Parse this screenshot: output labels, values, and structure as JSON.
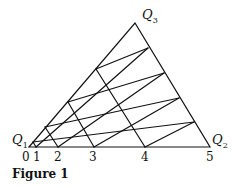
{
  "vertices": {
    "q1": {
      "label": "Q",
      "sub": "1"
    },
    "q2": {
      "label": "Q",
      "sub": "2"
    },
    "q3": {
      "label": "Q",
      "sub": "3"
    }
  },
  "ticks": [
    "0",
    "1",
    "2",
    "3",
    "4",
    "5"
  ],
  "caption": "Figure 1",
  "geometry": {
    "Q1": [
      29,
      147
    ],
    "Q2": [
      210,
      147
    ],
    "Q3": [
      135,
      23
    ],
    "base_ticks_x": [
      29,
      36,
      58,
      94,
      145,
      210
    ],
    "left_edge_points": [
      [
        33,
        142
      ],
      [
        45,
        127
      ],
      [
        68,
        102
      ],
      [
        96,
        69
      ]
    ],
    "right_edge_points": [
      [
        194,
        122
      ],
      [
        179,
        98
      ],
      [
        164,
        73
      ],
      [
        148,
        48
      ]
    ]
  },
  "colors": {
    "line": "#111111",
    "background": "#ffffff"
  }
}
